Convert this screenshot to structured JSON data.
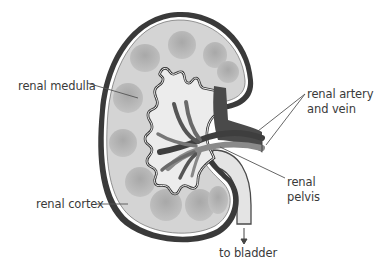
{
  "diagram": {
    "labels": {
      "renal_medulla": "renal medulla",
      "renal_artery_line1": "renal artery",
      "renal_artery_line2": "and vein",
      "renal_pelvis_line1": "renal",
      "renal_pelvis_line2": "pelvis",
      "renal_cortex": "renal cortex",
      "to_bladder": "to bladder"
    },
    "colors": {
      "capsule": "#3a3a3a",
      "cortex": "#d4d4d4",
      "medulla_pyramid": "#b0b0b0",
      "pelvis_fill": "#e6e6e6",
      "vein": "#4a4a4a",
      "artery": "#8a8a8a",
      "leader_line": "#555555",
      "text": "#3a3a3a"
    }
  }
}
